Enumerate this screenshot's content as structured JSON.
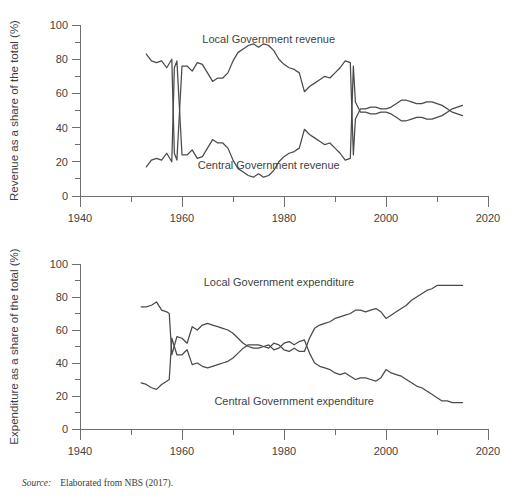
{
  "source_note": {
    "label": "Source:",
    "text": "Elaborated from NBS (2017)."
  },
  "chart_data": [
    {
      "id": "revenue",
      "type": "line",
      "title": "",
      "xlabel": "",
      "ylabel": "Revenue as a share of the total (%)",
      "xlim": [
        1940,
        2020
      ],
      "ylim": [
        0,
        100
      ],
      "xticks": [
        1940,
        1950,
        1960,
        1970,
        1980,
        1990,
        2000,
        2010,
        2020
      ],
      "xticklabels": [
        "1940",
        "",
        "1960",
        "",
        "1980",
        "",
        "2000",
        "",
        "2020"
      ],
      "yticks": [
        0,
        10,
        20,
        30,
        40,
        50,
        60,
        70,
        80,
        90,
        100
      ],
      "yticklabels": [
        "0",
        "",
        "20",
        "",
        "40",
        "",
        "60",
        "",
        "80",
        "",
        "100"
      ],
      "grid": false,
      "legend_position": "inline-annotation",
      "annotations": [
        {
          "text": "Local Government revenue",
          "x": 1977,
          "y": 92
        },
        {
          "text": "Central Government revenue",
          "x": 1977,
          "y": 18
        }
      ],
      "series": [
        {
          "name": "Local Government revenue",
          "x": [
            1953,
            1954,
            1955,
            1956,
            1957,
            1958,
            1958.5,
            1959,
            1960,
            1961,
            1962,
            1963,
            1964,
            1965,
            1966,
            1967,
            1968,
            1969,
            1970,
            1971,
            1972,
            1973,
            1974,
            1975,
            1976,
            1977,
            1978,
            1979,
            1980,
            1981,
            1982,
            1983,
            1984,
            1985,
            1986,
            1987,
            1988,
            1989,
            1990,
            1991,
            1992,
            1993,
            1993.6,
            1994,
            1995,
            1996,
            1997,
            1998,
            1999,
            2000,
            2001,
            2002,
            2003,
            2004,
            2005,
            2006,
            2007,
            2008,
            2009,
            2010,
            2011,
            2012,
            2013,
            2014,
            2015
          ],
          "y": [
            83,
            79,
            78,
            79,
            75,
            80,
            25,
            21,
            76,
            76,
            73,
            78,
            77,
            72,
            67,
            69,
            69,
            72,
            79,
            84,
            86,
            88,
            89,
            87,
            89,
            88,
            85,
            80,
            77,
            75,
            74,
            72,
            61,
            64,
            66,
            68,
            70,
            69,
            72,
            75,
            79,
            78,
            24,
            45,
            51,
            51,
            52,
            52,
            51,
            51,
            52,
            54,
            56,
            56,
            55,
            54,
            54,
            55,
            55,
            54,
            53,
            51,
            49,
            48,
            47
          ]
        },
        {
          "name": "Central Government revenue",
          "x": [
            1953,
            1954,
            1955,
            1956,
            1957,
            1958,
            1958.5,
            1959,
            1960,
            1961,
            1962,
            1963,
            1964,
            1965,
            1966,
            1967,
            1968,
            1969,
            1970,
            1971,
            1972,
            1973,
            1974,
            1975,
            1976,
            1977,
            1978,
            1979,
            1980,
            1981,
            1982,
            1983,
            1984,
            1985,
            1986,
            1987,
            1988,
            1989,
            1990,
            1991,
            1992,
            1993,
            1993.6,
            1994,
            1995,
            1996,
            1997,
            1998,
            1999,
            2000,
            2001,
            2002,
            2003,
            2004,
            2005,
            2006,
            2007,
            2008,
            2009,
            2010,
            2011,
            2012,
            2013,
            2014,
            2015
          ],
          "y": [
            17,
            21,
            22,
            21,
            25,
            20,
            75,
            79,
            24,
            24,
            27,
            22,
            23,
            28,
            33,
            31,
            31,
            28,
            21,
            16,
            14,
            12,
            11,
            13,
            11,
            12,
            15,
            20,
            23,
            25,
            26,
            28,
            39,
            36,
            34,
            32,
            30,
            31,
            28,
            25,
            21,
            22,
            76,
            55,
            49,
            49,
            48,
            48,
            49,
            49,
            48,
            46,
            44,
            44,
            45,
            46,
            46,
            45,
            45,
            46,
            47,
            49,
            51,
            52,
            53
          ]
        }
      ]
    },
    {
      "id": "expenditure",
      "type": "line",
      "title": "",
      "xlabel": "",
      "ylabel": "Expenditure as a share of the total (%)",
      "xlim": [
        1940,
        2020
      ],
      "ylim": [
        0,
        100
      ],
      "xticks": [
        1940,
        1950,
        1960,
        1970,
        1980,
        1990,
        2000,
        2010,
        2020
      ],
      "xticklabels": [
        "1940",
        "",
        "1960",
        "",
        "1980",
        "",
        "2000",
        "",
        "2020"
      ],
      "yticks": [
        0,
        10,
        20,
        30,
        40,
        50,
        60,
        70,
        80,
        90,
        100
      ],
      "yticklabels": [
        "0",
        "",
        "20",
        "",
        "40",
        "",
        "60",
        "",
        "80",
        "",
        "100"
      ],
      "grid": false,
      "legend_position": "inline-annotation",
      "annotations": [
        {
          "text": "Local Government expenditure",
          "x": 1979,
          "y": 89
        },
        {
          "text": "Central Government expenditure",
          "x": 1982,
          "y": 17
        }
      ],
      "series": [
        {
          "name": "Central Government expenditure",
          "x": [
            1952,
            1953,
            1954,
            1955,
            1956,
            1957,
            1957.5,
            1958,
            1959,
            1960,
            1961,
            1962,
            1963,
            1964,
            1965,
            1966,
            1967,
            1968,
            1969,
            1970,
            1971,
            1972,
            1973,
            1974,
            1975,
            1976,
            1977,
            1978,
            1979,
            1980,
            1981,
            1982,
            1983,
            1984,
            1985,
            1986,
            1987,
            1988,
            1989,
            1990,
            1991,
            1992,
            1993,
            1994,
            1995,
            1996,
            1997,
            1998,
            1999,
            2000,
            2001,
            2002,
            2003,
            2004,
            2005,
            2006,
            2007,
            2008,
            2009,
            2010,
            2011,
            2012,
            2013,
            2014,
            2015
          ],
          "y": [
            74,
            74,
            75,
            77,
            72,
            71,
            70,
            45,
            56,
            55,
            52,
            62,
            60,
            63,
            64,
            63,
            62,
            61,
            60,
            58,
            55,
            52,
            50,
            49,
            49,
            50,
            51,
            48,
            49,
            52,
            53,
            51,
            53,
            54,
            46,
            40,
            38,
            37,
            36,
            34,
            33,
            34,
            32,
            30,
            31,
            31,
            30,
            29,
            31,
            36,
            34,
            33,
            32,
            30,
            28,
            26,
            25,
            23,
            21,
            19,
            17,
            17,
            16,
            16,
            16
          ]
        },
        {
          "name": "Local Government expenditure",
          "x": [
            1952,
            1953,
            1954,
            1955,
            1956,
            1957,
            1957.5,
            1958,
            1959,
            1960,
            1961,
            1962,
            1963,
            1964,
            1965,
            1966,
            1967,
            1968,
            1969,
            1970,
            1971,
            1972,
            1973,
            1974,
            1975,
            1976,
            1977,
            1978,
            1979,
            1980,
            1981,
            1982,
            1983,
            1984,
            1985,
            1986,
            1987,
            1988,
            1989,
            1990,
            1991,
            1992,
            1993,
            1994,
            1995,
            1996,
            1997,
            1998,
            1999,
            2000,
            2001,
            2002,
            2003,
            2004,
            2005,
            2006,
            2007,
            2008,
            2009,
            2010,
            2011,
            2012,
            2013,
            2014,
            2015
          ],
          "y": [
            28,
            27,
            25,
            24,
            27,
            29,
            30,
            55,
            45,
            45,
            48,
            39,
            40,
            38,
            37,
            38,
            39,
            40,
            41,
            43,
            46,
            49,
            51,
            51,
            51,
            50,
            49,
            52,
            51,
            48,
            47,
            49,
            47,
            47,
            55,
            61,
            63,
            64,
            65,
            67,
            68,
            69,
            70,
            72,
            72,
            71,
            72,
            73,
            71,
            67,
            69,
            71,
            73,
            75,
            78,
            80,
            82,
            84,
            85,
            87,
            87,
            87,
            87,
            87,
            87
          ]
        }
      ]
    }
  ]
}
